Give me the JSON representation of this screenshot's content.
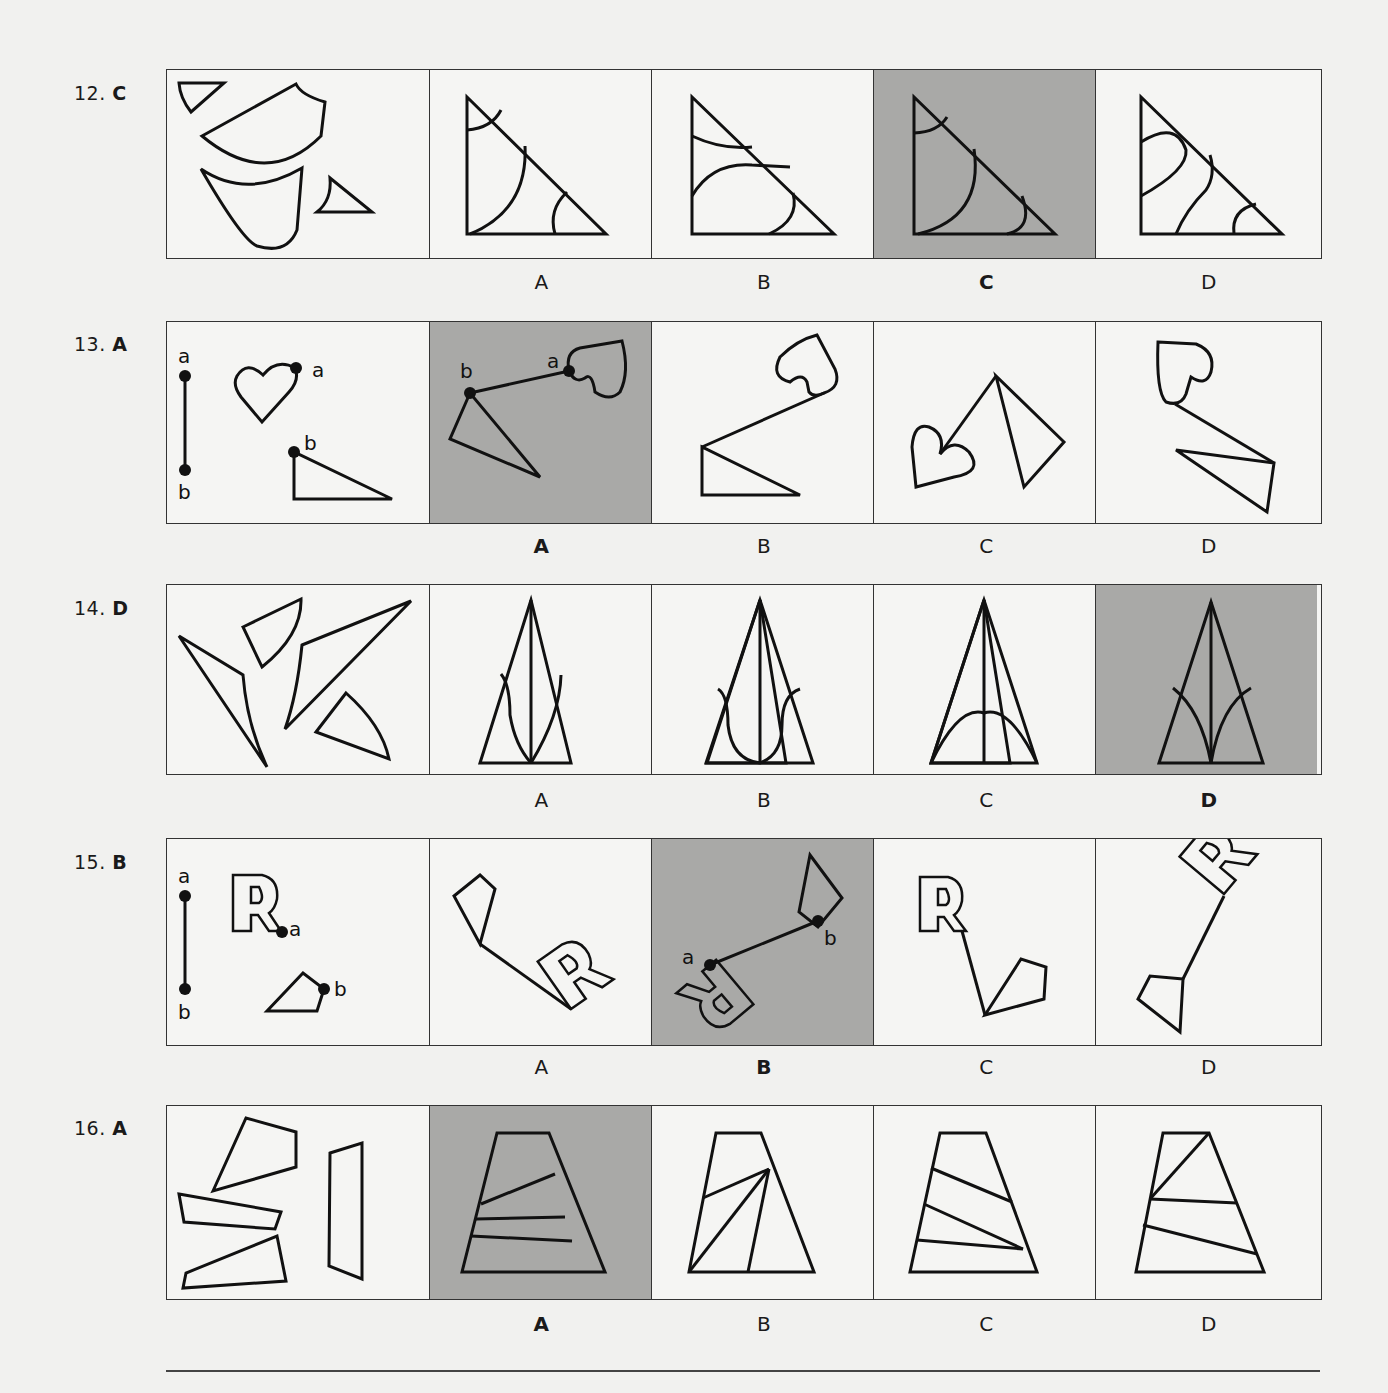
{
  "questions": [
    {
      "number": "12.",
      "answer": "C",
      "options": [
        "A",
        "B",
        "C",
        "D"
      ],
      "selected": "C"
    },
    {
      "number": "13.",
      "answer": "A",
      "options": [
        "A",
        "B",
        "C",
        "D"
      ],
      "selected": "A",
      "point_labels": [
        "a",
        "b"
      ]
    },
    {
      "number": "14.",
      "answer": "D",
      "options": [
        "A",
        "B",
        "C",
        "D"
      ],
      "selected": "D"
    },
    {
      "number": "15.",
      "answer": "B",
      "options": [
        "A",
        "B",
        "C",
        "D"
      ],
      "selected": "B",
      "point_labels": [
        "a",
        "b"
      ],
      "letter_shape": "R"
    },
    {
      "number": "16.",
      "answer": "A",
      "options": [
        "A",
        "B",
        "C",
        "D"
      ],
      "selected": "A"
    }
  ],
  "colors": {
    "selected_bg": "#a9a9a7",
    "page_bg": "#f1f1ef",
    "line": "#111111"
  }
}
